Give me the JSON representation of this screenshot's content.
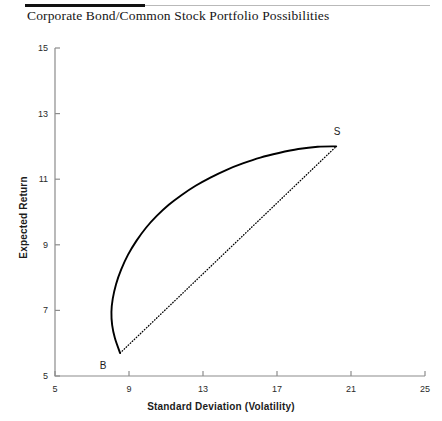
{
  "figure": {
    "title": "Corporate Bond/Common Stock Portfolio Possibilities"
  },
  "chart_data": {
    "type": "line",
    "title": "Corporate Bond/Common Stock Portfolio Possibilities",
    "xlabel": "Standard Deviation (Volatility)",
    "ylabel": "Expected Return",
    "xlim": [
      5,
      25
    ],
    "ylim": [
      5,
      15
    ],
    "xticks": [
      5,
      9,
      13,
      17,
      21,
      25
    ],
    "yticks": [
      5,
      7,
      9,
      11,
      13,
      15
    ],
    "xtick_labels": [
      "5",
      "9",
      "13",
      "17",
      "21",
      "25"
    ],
    "ytick_labels": [
      "5",
      "7",
      "9",
      "11",
      "13",
      "15"
    ],
    "grid": false,
    "legend": false,
    "legend_position": "none",
    "series": [
      {
        "name": "Portfolio possibilities curve (correlation < 1)",
        "style": "solid",
        "color": "#000000",
        "points": [
          [
            8.52,
            5.7
          ],
          [
            8.24,
            6.15
          ],
          [
            8.09,
            6.55
          ],
          [
            8.05,
            6.95
          ],
          [
            8.12,
            7.35
          ],
          [
            8.3,
            7.8
          ],
          [
            8.58,
            8.25
          ],
          [
            8.95,
            8.7
          ],
          [
            9.4,
            9.12
          ],
          [
            9.92,
            9.52
          ],
          [
            10.5,
            9.88
          ],
          [
            11.15,
            10.22
          ],
          [
            11.85,
            10.52
          ],
          [
            12.6,
            10.8
          ],
          [
            13.4,
            11.05
          ],
          [
            14.25,
            11.28
          ],
          [
            15.15,
            11.48
          ],
          [
            16.1,
            11.66
          ],
          [
            17.1,
            11.8
          ],
          [
            18.15,
            11.92
          ],
          [
            19.2,
            11.99
          ],
          [
            20.2,
            12.0
          ]
        ]
      },
      {
        "name": "Portfolio possibilities line (perfect correlation)",
        "style": "dotted",
        "color": "#000000",
        "points": [
          [
            8.52,
            5.7
          ],
          [
            20.2,
            12.0
          ]
        ]
      }
    ],
    "annotations": [
      {
        "label": "B",
        "x": 8.52,
        "y": 5.7,
        "description": "100% corporate bonds"
      },
      {
        "label": "S",
        "x": 20.2,
        "y": 12.0,
        "description": "100% common stock"
      }
    ]
  },
  "axes": {
    "y_ticks": [
      {
        "label": "15",
        "value": 15
      },
      {
        "label": "13",
        "value": 13
      },
      {
        "label": "11",
        "value": 11
      },
      {
        "label": "9",
        "value": 9
      },
      {
        "label": "7",
        "value": 7
      },
      {
        "label": "5",
        "value": 5
      }
    ],
    "x_ticks": [
      {
        "label": "5",
        "value": 5
      },
      {
        "label": "9",
        "value": 9
      },
      {
        "label": "13",
        "value": 13
      },
      {
        "label": "17",
        "value": 17
      },
      {
        "label": "21",
        "value": 21
      },
      {
        "label": "25",
        "value": 25
      }
    ],
    "x_title": "Standard Deviation (Volatility)",
    "y_title": "Expected Return"
  },
  "labels": {
    "b_point": "B",
    "s_point": "S"
  },
  "colors": {
    "curve": "#000000",
    "axis": "#8c8c8c",
    "rule_dark": "#111111",
    "rule_light": "#b9b9b9",
    "text": "#1c1c1c"
  }
}
